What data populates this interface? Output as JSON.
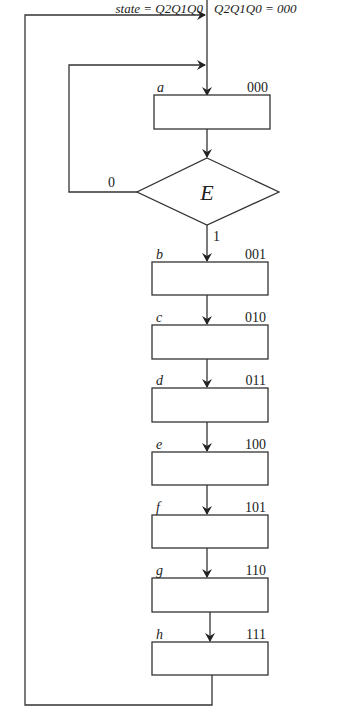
{
  "header": {
    "state_label": "state = Q2Q1Q0",
    "init_label": "Q2Q1Q0 =  000"
  },
  "decision": {
    "name": "E",
    "false_label": "0",
    "true_label": "1"
  },
  "states": [
    {
      "name": "a",
      "code": "000"
    },
    {
      "name": "b",
      "code": "001"
    },
    {
      "name": "c",
      "code": "010"
    },
    {
      "name": "d",
      "code": "011"
    },
    {
      "name": "e",
      "code": "100"
    },
    {
      "name": "f",
      "code": "101"
    },
    {
      "name": "g",
      "code": "110"
    },
    {
      "name": "h",
      "code": "111"
    }
  ]
}
